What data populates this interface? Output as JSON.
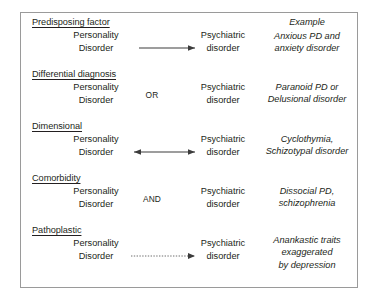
{
  "diagram": {
    "left_column_lines": [
      "Personality",
      "Disorder"
    ],
    "middle_column_lines": [
      "Psychiatric",
      "disorder"
    ],
    "example_header": "Example",
    "sections": [
      {
        "id": "predisposing-factor",
        "heading": "Predisposing factor",
        "left_lines": [
          "Personality",
          "Disorder"
        ],
        "connector_type": "single-arrow-right",
        "connector_label": "",
        "middle_lines": [
          "Psychiatric",
          "disorder"
        ],
        "example_lines": [
          "Anxious PD and",
          "anxiety disorder"
        ]
      },
      {
        "id": "differential-diagnosis",
        "heading": "Differential diagnosis",
        "left_lines": [
          "Personality",
          "Disorder"
        ],
        "connector_type": "text-label",
        "connector_label": "OR",
        "middle_lines": [
          "Psychiatric",
          "disorder"
        ],
        "example_lines": [
          "Paranoid PD or",
          "Delusional disorder"
        ]
      },
      {
        "id": "dimensional",
        "heading": "Dimensional",
        "left_lines": [
          "Personality",
          "Disorder"
        ],
        "connector_type": "double-arrow",
        "connector_label": "",
        "middle_lines": [
          "Psychiatric",
          "disorder"
        ],
        "example_lines": [
          "Cyclothymia,",
          "Schizotypal disorder"
        ]
      },
      {
        "id": "comorbidity",
        "heading": "Comorbidity",
        "left_lines": [
          "Personality",
          "Disorder"
        ],
        "connector_type": "text-label",
        "connector_label": "AND",
        "middle_lines": [
          "Psychiatric",
          "disorder"
        ],
        "example_lines": [
          "Dissocial PD,",
          "schizophrenia"
        ]
      },
      {
        "id": "pathoplastic",
        "heading": "Pathoplastic",
        "left_lines": [
          "Personality",
          "Disorder"
        ],
        "connector_type": "dotted-arrow-right",
        "connector_label": "",
        "middle_lines": [
          "Psychiatric",
          "disorder"
        ],
        "example_lines": [
          "Anankastic traits",
          "exaggerated",
          "by depression"
        ]
      }
    ],
    "colors": {
      "border": "#9a9a9a",
      "text": "#231f20",
      "arrow": "#3c3c3c",
      "background": "#ffffff"
    }
  }
}
